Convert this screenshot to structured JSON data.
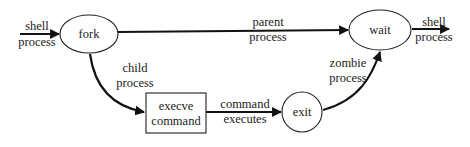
{
  "diagram": {
    "type": "flowchart",
    "nodes": [
      {
        "id": "fork",
        "label": "fork",
        "shape": "ellipse"
      },
      {
        "id": "wait",
        "label": "wait",
        "shape": "ellipse"
      },
      {
        "id": "execve",
        "label_line1": "execve",
        "label_line2": "command",
        "shape": "rectangle"
      },
      {
        "id": "exit",
        "label": "exit",
        "shape": "circle"
      }
    ],
    "edges": [
      {
        "from": "input",
        "to": "fork",
        "label_line1": "shell",
        "label_line2": "process"
      },
      {
        "from": "fork",
        "to": "wait",
        "label_line1": "parent",
        "label_line2": "process"
      },
      {
        "from": "wait",
        "to": "output",
        "label_line1": "shell",
        "label_line2": "process"
      },
      {
        "from": "fork",
        "to": "execve",
        "label_line1": "child",
        "label_line2": "process"
      },
      {
        "from": "execve",
        "to": "exit",
        "label_line1": "command",
        "label_line2": "executes"
      },
      {
        "from": "exit",
        "to": "wait",
        "label_line1": "zombie",
        "label_line2": "process"
      }
    ]
  }
}
